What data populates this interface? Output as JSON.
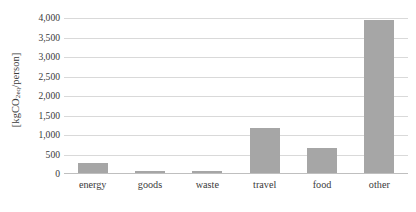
{
  "chart_data": {
    "type": "bar",
    "title": "",
    "subtitle": "",
    "xlabel": "",
    "ylabel": "[kgCO2eq/person]",
    "ylabel_parts": {
      "prefix": "[kgCO",
      "subscript": "2eq",
      "suffix": "/person]"
    },
    "categories": [
      "energy",
      "goods",
      "waste",
      "travel",
      "food",
      "other"
    ],
    "values": [
      270,
      80,
      90,
      1170,
      660,
      3950
    ],
    "series": [
      {
        "name": "emissions",
        "values": [
          270,
          80,
          90,
          1170,
          660,
          3950
        ]
      }
    ],
    "ylim": [
      0,
      4000
    ],
    "ytick_step": 500,
    "ytick_values": [
      0,
      500,
      1000,
      1500,
      2000,
      2500,
      3000,
      3500,
      4000
    ],
    "ytick_labels": [
      "0",
      "500",
      "1,000",
      "1,500",
      "2,000",
      "2,500",
      "3,000",
      "3,500",
      "4,000"
    ],
    "grid": true,
    "grid_axis": "y",
    "legend": false,
    "legend_position": "none",
    "bar_color": "#a6a6a6",
    "gridline_color": "#d9d9d9",
    "axis_color": "#bfbfbf",
    "background_color": "#ffffff",
    "text_color": "#3a3a3a"
  }
}
